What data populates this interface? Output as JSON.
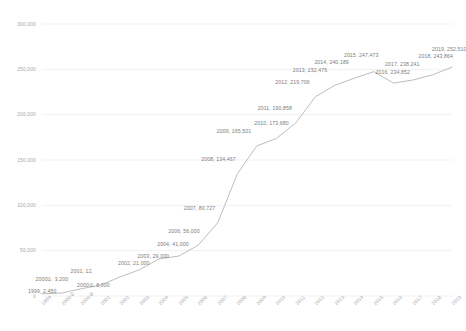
{
  "chart_data": {
    "type": "line",
    "title": "",
    "subtitle": "",
    "xlabel": "",
    "ylabel": "",
    "grid": true,
    "legend_position": "none",
    "ylim": [
      0,
      300000
    ],
    "yticks": [
      0,
      50000,
      100000,
      150000,
      200000,
      250000,
      300000
    ],
    "ytick_labels": [
      "0",
      "50,000",
      "100,000",
      "150,000",
      "200,000",
      "250,000",
      "300,000"
    ],
    "categories": [
      "1999",
      "2000①",
      "2000②",
      "2001",
      "2002",
      "2003",
      "2004",
      "2005",
      "2006",
      "2007",
      "2008",
      "2009",
      "2010",
      "2011",
      "2012",
      "2013",
      "2014",
      "2015",
      "2016",
      "2017",
      "2018",
      "2019"
    ],
    "x_tick_labels": [
      "1999",
      "2000①",
      "2000②",
      "2001",
      "2002",
      "2003",
      "2004",
      "2005",
      "2006",
      "2007",
      "2008",
      "2009",
      "2010",
      "2011",
      "2012",
      "2013",
      "2014",
      "2015",
      "2016",
      "2017",
      "2018",
      "2019"
    ],
    "values": [
      2450,
      3200,
      8000,
      12000,
      21000,
      29000,
      41000,
      44000,
      56000,
      80727,
      134467,
      165501,
      173680,
      190858,
      219706,
      232476,
      240189,
      247473,
      234852,
      238241,
      243864,
      252510
    ],
    "point_labels": [
      "1999, 2,450",
      "2000①, 3,200",
      "2000②, 8,000",
      "2001, 12,",
      "2002, 21,000",
      "2003, 29,000",
      "2004, 41,000",
      "",
      "2006, 56,000",
      "2007, 80,727",
      "2008, 134,467",
      "2009, 165,501",
      "2010, 173,680",
      "2011, 190,858",
      "2012, 219,706",
      "2013, 232,476",
      "2014, 240,189",
      "2015, 247,473",
      "2016, 234,852",
      "2017, 238,241",
      "2018, 243,864",
      "2019, 252,510"
    ],
    "line_color": "#b5b5b5",
    "grid_color": "#ebebeb",
    "label_color": "#7d7d7d",
    "axis_label_color": "#a8a8a8"
  }
}
